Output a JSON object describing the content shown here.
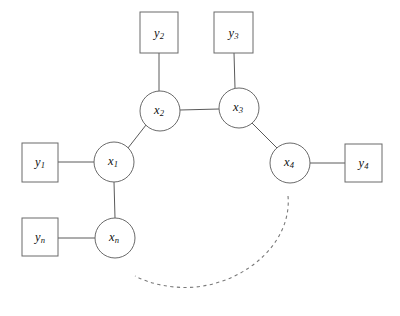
{
  "diagram": {
    "type": "undirected-graphical-model",
    "title": "",
    "width": 400,
    "height": 316,
    "colors": {
      "background": "#ffffff",
      "stroke": "#5a5a5a",
      "node_stroke": "#6a6a6a",
      "node_fill": "#ffffff",
      "label": "#111111",
      "dashed": "#7a7a7a"
    },
    "latent_nodes": [
      {
        "id": "x1",
        "base": "x",
        "sub": "1",
        "cx": 114,
        "cy": 162,
        "r": 20
      },
      {
        "id": "x2",
        "base": "x",
        "sub": "2",
        "cx": 160,
        "cy": 111,
        "r": 20
      },
      {
        "id": "x3",
        "base": "x",
        "sub": "3",
        "cx": 239,
        "cy": 108,
        "r": 20
      },
      {
        "id": "x4",
        "base": "x",
        "sub": "4",
        "cx": 290,
        "cy": 163,
        "r": 20
      },
      {
        "id": "xn",
        "base": "x",
        "sub": "n",
        "cx": 115,
        "cy": 238,
        "r": 20
      }
    ],
    "observed_nodes": [
      {
        "id": "y1",
        "base": "y",
        "sub": "1",
        "x": 22,
        "y": 143,
        "w": 36,
        "h": 39
      },
      {
        "id": "y2",
        "base": "y",
        "sub": "2",
        "x": 140,
        "y": 12,
        "w": 38,
        "h": 41
      },
      {
        "id": "y3",
        "base": "y",
        "sub": "3",
        "x": 214,
        "y": 12,
        "w": 39,
        "h": 41
      },
      {
        "id": "y4",
        "base": "y",
        "sub": "4",
        "x": 345,
        "y": 144,
        "w": 37,
        "h": 38
      },
      {
        "id": "yn",
        "base": "y",
        "sub": "n",
        "x": 22,
        "y": 218,
        "w": 36,
        "h": 38
      }
    ],
    "edges": [
      {
        "from": "y1",
        "to": "x1",
        "x1": 58,
        "y1": 162,
        "x2": 94,
        "y2": 162
      },
      {
        "from": "yn",
        "to": "xn",
        "x1": 58,
        "y1": 238,
        "x2": 95,
        "y2": 238
      },
      {
        "from": "y2",
        "to": "x2",
        "x1": 159,
        "y1": 53,
        "x2": 159,
        "y2": 91
      },
      {
        "from": "y3",
        "to": "x3",
        "x1": 234,
        "y1": 53,
        "x2": 235,
        "y2": 88
      },
      {
        "from": "y4",
        "to": "x4",
        "x1": 310,
        "y1": 163,
        "x2": 345,
        "y2": 163
      },
      {
        "from": "x1",
        "to": "x2",
        "x1": 128,
        "y1": 148,
        "x2": 146,
        "y2": 125
      },
      {
        "from": "x1",
        "to": "xn",
        "x1": 114,
        "y1": 182,
        "x2": 115,
        "y2": 218
      },
      {
        "from": "x2",
        "to": "x3",
        "x1": 180,
        "y1": 110,
        "x2": 219,
        "y2": 109
      },
      {
        "from": "x3",
        "to": "x4",
        "x1": 252,
        "y1": 123,
        "x2": 277,
        "y2": 148
      }
    ],
    "dashed_arc": {
      "label": "continuation-arc",
      "path": "M 288 196 C 292 240 250 281 196 287 C 172 289 150 284 135 276"
    }
  }
}
